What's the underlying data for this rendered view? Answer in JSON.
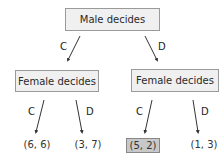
{
  "root": {
    "label": "Male decides"
  },
  "children": [
    {
      "label": "Female decides",
      "edge_label": "C"
    },
    {
      "label": "Female decides",
      "edge_label": "D"
    }
  ],
  "leaves": [
    {
      "edge_label": "C",
      "payoff": "(6, 6)",
      "highlighted": false
    },
    {
      "edge_label": "D",
      "payoff": "(3, 7)",
      "highlighted": false
    },
    {
      "edge_label": "C",
      "payoff": "(5, 2)",
      "highlighted": true
    },
    {
      "edge_label": "D",
      "payoff": "(1, 3)",
      "highlighted": false
    }
  ],
  "colors": {
    "node_fill": "#f0f0f0",
    "highlight_fill": "#c8c8c8",
    "edge": "#333333"
  }
}
